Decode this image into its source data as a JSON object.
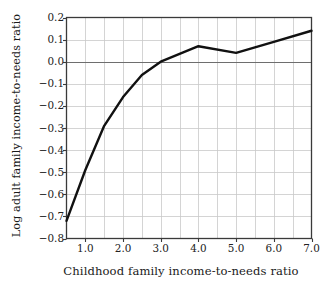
{
  "chart_data": {
    "type": "line",
    "title": "",
    "xlabel": "Childhood family income-to-needs ratio",
    "ylabel": "Log adult family income-to-needs ratio",
    "xlim": [
      0.5,
      7.0
    ],
    "ylim": [
      -0.8,
      0.2
    ],
    "grid": true,
    "legend": "none",
    "x_ticks": [
      "1.0",
      "2.0",
      "3.0",
      "4.0",
      "5.0",
      "6.0",
      "7.0"
    ],
    "x_tick_values": [
      1.0,
      2.0,
      3.0,
      4.0,
      5.0,
      6.0,
      7.0
    ],
    "x_minor_gridlines": [
      1.0,
      1.5,
      2.0,
      2.5,
      3.0,
      3.5,
      4.0,
      4.5,
      5.0,
      5.5,
      6.0,
      6.5
    ],
    "y_ticks": [
      "0.2",
      "0.1",
      "0.0",
      "−0.1",
      "−0.2",
      "−0.3",
      "−0.4",
      "−0.5",
      "−0.6",
      "−0.7",
      "−0.8"
    ],
    "y_tick_values": [
      0.2,
      0.1,
      0.0,
      -0.1,
      -0.2,
      -0.3,
      -0.4,
      -0.5,
      -0.6,
      -0.7,
      -0.8
    ],
    "series": [
      {
        "name": "Log adult family income-to-needs ratio",
        "color": "#111111",
        "line_width": 2.4,
        "x": [
          0.5,
          1.0,
          1.5,
          2.0,
          2.5,
          3.0,
          4.0,
          5.0,
          6.0,
          7.0
        ],
        "values": [
          -0.72,
          -0.49,
          -0.29,
          -0.16,
          -0.06,
          0.0,
          0.07,
          0.04,
          0.09,
          0.14
        ]
      }
    ],
    "zero_line": 0.0,
    "grid_color": "#c9c9c9",
    "axis_color": "#3a3a3a"
  }
}
